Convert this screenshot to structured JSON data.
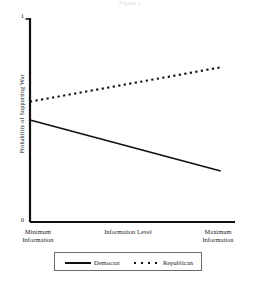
{
  "figure": {
    "title_faint": "Figure 1"
  },
  "chart_data": {
    "type": "line",
    "title": "",
    "xlabel": "Information Level",
    "ylabel": "Probability of Supporting War",
    "xlim": [
      0,
      1
    ],
    "ylim": [
      0,
      1
    ],
    "grid": false,
    "legend_position": "bottom",
    "x_tick_labels": [
      "Minimum Information",
      "Maximum Information"
    ],
    "x_tick_line1": [
      "Minimum",
      "Maximum"
    ],
    "x_tick_line2": [
      "Information",
      "Information"
    ],
    "y_tick_labels": [
      "0",
      "1"
    ],
    "y_ticks": [
      0,
      1
    ],
    "x": [
      0,
      1
    ],
    "series": [
      {
        "name": "Democrat",
        "style": "solid",
        "color": "#111111",
        "values": [
          0.5,
          0.25
        ]
      },
      {
        "name": "Republican",
        "style": "dotted",
        "color": "#111111",
        "values": [
          0.59,
          0.76
        ]
      }
    ],
    "legend": [
      {
        "label": "Democrat",
        "style": "solid"
      },
      {
        "label": "Republican",
        "style": "dotted"
      }
    ]
  },
  "axis_geometry": {
    "left": 30,
    "right": 235,
    "top": 18,
    "bottom": 222
  }
}
